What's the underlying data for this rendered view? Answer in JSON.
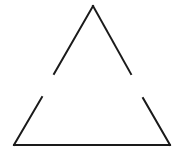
{
  "diagram": {
    "title": "",
    "background": "#ffffff",
    "stroke_color": "#1a1a1a",
    "stroke_width": 2,
    "segments": [
      {
        "name": "upper-left-edge",
        "x1": 93,
        "y1": 6,
        "x2": 54,
        "y2": 74
      },
      {
        "name": "upper-right-edge",
        "x1": 93,
        "y1": 6,
        "x2": 131,
        "y2": 74
      },
      {
        "name": "lower-left-edge",
        "x1": 42,
        "y1": 97,
        "x2": 14,
        "y2": 145
      },
      {
        "name": "lower-right-edge",
        "x1": 143,
        "y1": 98,
        "x2": 170,
        "y2": 145
      },
      {
        "name": "base-edge",
        "x1": 14,
        "y1": 145,
        "x2": 170,
        "y2": 145
      }
    ]
  }
}
